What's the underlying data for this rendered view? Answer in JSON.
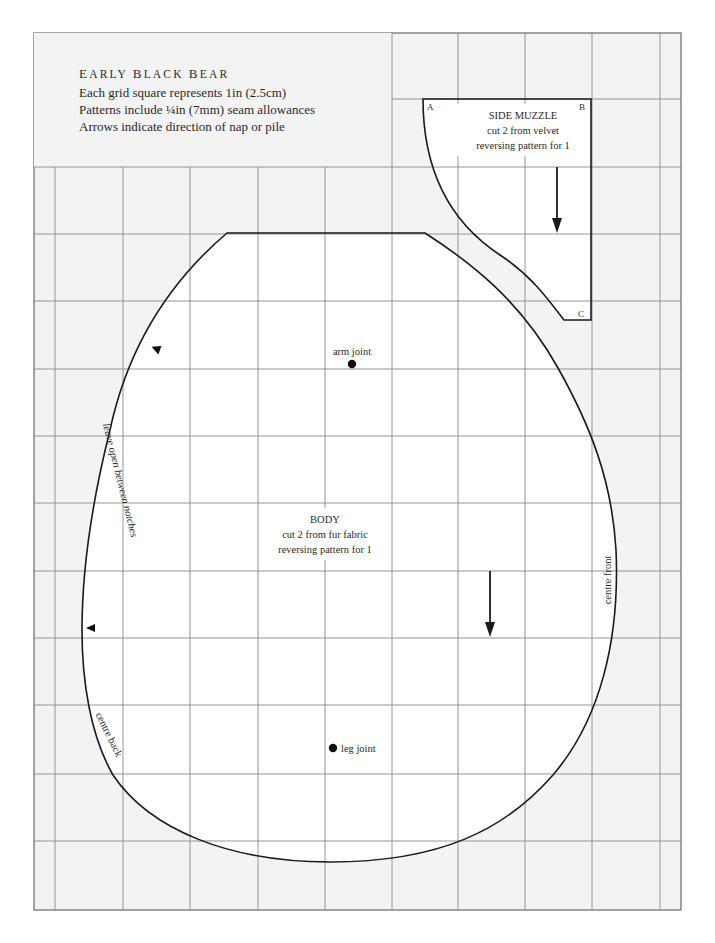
{
  "header": {
    "title": "Early Black Bear",
    "title_display": "EARLY BLACK BEAR",
    "lines": [
      "Each grid square represents 1in (2.5cm)",
      "Patterns include ¼in (7mm) seam allowances",
      "Arrows indicate direction of nap or pile"
    ]
  },
  "grid": {
    "square_size": "1in (2.5cm)",
    "background_color": "#f3f3f3",
    "piece_fill_color": "#ffffff",
    "line_color": "#8a8a8a",
    "outline_color": "#1a1a1a"
  },
  "side_muzzle": {
    "name": "SIDE MUZZLE",
    "instruction": "cut 2 from velvet",
    "reversing": "reversing pattern for 1",
    "corner_a": "A",
    "corner_b": "B",
    "corner_c": "C"
  },
  "body": {
    "name": "BODY",
    "instruction": "cut 2 from fur fabric",
    "reversing": "reversing pattern for 1",
    "arm_joint": "arm joint",
    "leg_joint": "leg joint",
    "leave_open": "leave open between notches",
    "centre_front": "centre front",
    "centre_back": "centre back"
  }
}
